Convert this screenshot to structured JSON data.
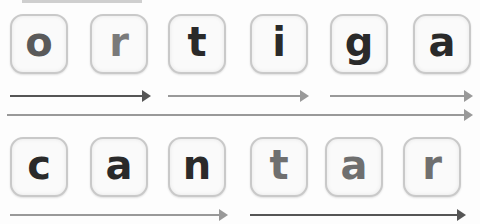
{
  "word1": {
    "text": "ortiga",
    "letters": [
      {
        "char": "o",
        "color": "#5a5a5a",
        "x": 10,
        "y": 14
      },
      {
        "char": "r",
        "color": "#7a7a7a",
        "x": 90,
        "y": 14
      },
      {
        "char": "t",
        "color": "#2a2a2a",
        "x": 168,
        "y": 14
      },
      {
        "char": "i",
        "color": "#2a2a2a",
        "x": 250,
        "y": 14
      },
      {
        "char": "g",
        "color": "#2a2a2a",
        "x": 330,
        "y": 14
      },
      {
        "char": "a",
        "color": "#2a2a2a",
        "x": 413,
        "y": 14
      }
    ],
    "arrows": [
      {
        "x1": 10,
        "x2": 151,
        "y": 96,
        "color": "#555555",
        "label": "syllable-or"
      },
      {
        "x1": 168,
        "x2": 309,
        "y": 96,
        "color": "#999999",
        "label": "syllable-ti"
      },
      {
        "x1": 330,
        "x2": 473,
        "y": 96,
        "color": "#999999",
        "label": "syllable-ga"
      },
      {
        "x1": 7,
        "x2": 473,
        "y": 115,
        "color": "#999999",
        "label": "whole-word"
      }
    ]
  },
  "word2": {
    "text": "cantar",
    "letters": [
      {
        "char": "c",
        "color": "#2a2a2a",
        "x": 10,
        "y": 137
      },
      {
        "char": "a",
        "color": "#2a2a2a",
        "x": 90,
        "y": 137
      },
      {
        "char": "n",
        "color": "#2a2a2a",
        "x": 168,
        "y": 137
      },
      {
        "char": "t",
        "color": "#6f6f6f",
        "x": 250,
        "y": 137
      },
      {
        "char": "a",
        "color": "#6f6f6f",
        "x": 325,
        "y": 137
      },
      {
        "char": "r",
        "color": "#6f6f6f",
        "x": 403,
        "y": 137
      }
    ],
    "arrows": [
      {
        "x1": 10,
        "x2": 228,
        "y": 215,
        "color": "#999999",
        "label": "syllable-can"
      },
      {
        "x1": 250,
        "x2": 466,
        "y": 215,
        "color": "#555555",
        "label": "syllable-tar"
      }
    ]
  }
}
